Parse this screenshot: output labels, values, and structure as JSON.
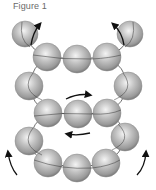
{
  "figure": {
    "title": "Figure 1",
    "sphere_color": "#b4b4b4",
    "sphere_highlight": "#f2f2f2",
    "sphere_shadow": "#6e6e6e",
    "bond_color": "#2a2a2a",
    "arrow_color": "#111111",
    "spheres": [
      {
        "id": "top-left",
        "cx": 25,
        "cy": 34,
        "r": 13
      },
      {
        "id": "top-row-1",
        "cx": 47,
        "cy": 57,
        "r": 14
      },
      {
        "id": "top-row-2",
        "cx": 77,
        "cy": 59,
        "r": 14
      },
      {
        "id": "top-row-3",
        "cx": 107,
        "cy": 57,
        "r": 14
      },
      {
        "id": "top-right",
        "cx": 130,
        "cy": 34,
        "r": 13
      },
      {
        "id": "mid-left",
        "cx": 29,
        "cy": 86,
        "r": 14
      },
      {
        "id": "mid-right",
        "cx": 128,
        "cy": 86,
        "r": 14
      },
      {
        "id": "mid-row-1",
        "cx": 48,
        "cy": 113,
        "r": 14
      },
      {
        "id": "mid-row-2",
        "cx": 78,
        "cy": 114,
        "r": 14
      },
      {
        "id": "mid-row-3",
        "cx": 107,
        "cy": 113,
        "r": 14
      },
      {
        "id": "low-left",
        "cx": 29,
        "cy": 141,
        "r": 14
      },
      {
        "id": "low-right",
        "cx": 125,
        "cy": 137,
        "r": 14
      },
      {
        "id": "bottom-row-1",
        "cx": 48,
        "cy": 163,
        "r": 14
      },
      {
        "id": "bottom-row-2",
        "cx": 77,
        "cy": 168,
        "r": 14
      },
      {
        "id": "bottom-row-3",
        "cx": 106,
        "cy": 163,
        "r": 14
      }
    ],
    "arrows": [
      {
        "id": "top-left-arrow",
        "direction": "up-right"
      },
      {
        "id": "top-right-arrow",
        "direction": "up-left"
      },
      {
        "id": "middle-upper-arrow",
        "direction": "right"
      },
      {
        "id": "middle-lower-arrow",
        "direction": "left"
      },
      {
        "id": "bottom-left-arrow",
        "direction": "up"
      },
      {
        "id": "bottom-right-arrow",
        "direction": "up"
      }
    ]
  }
}
